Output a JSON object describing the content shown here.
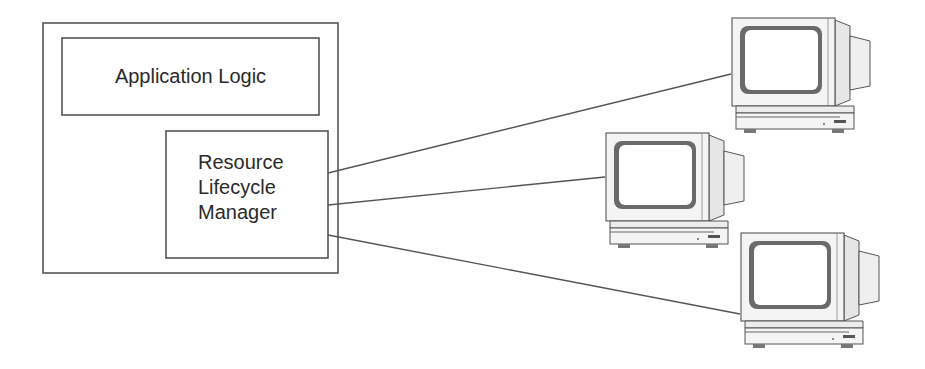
{
  "diagram": {
    "outer_box": {
      "label": ""
    },
    "application_logic": {
      "label": "Application Logic"
    },
    "resource_lifecycle_manager": {
      "lines": [
        "Resource",
        "Lifecycle",
        "Manager"
      ]
    },
    "computers": [
      {
        "name": "computer-top",
        "x": 730,
        "y": 18
      },
      {
        "name": "computer-middle",
        "x": 604,
        "y": 133
      },
      {
        "name": "computer-bottom",
        "x": 739,
        "y": 233
      }
    ],
    "connections": [
      {
        "from": [
          328,
          173
        ],
        "to": [
          731,
          74
        ]
      },
      {
        "from": [
          328,
          205
        ],
        "to": [
          605,
          177
        ]
      },
      {
        "from": [
          328,
          235
        ],
        "to": [
          740,
          314
        ]
      }
    ],
    "colors": {
      "stroke": "#555555",
      "text": "#2a2a2a",
      "monitor_body": "#f2f2f2",
      "screen_bezel": "#6a6a6a"
    }
  }
}
